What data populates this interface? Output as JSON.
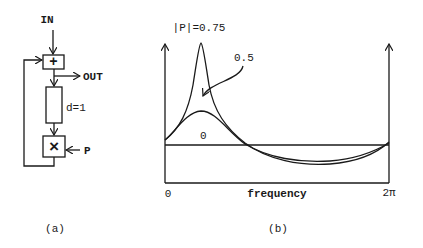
{
  "panel_a": {
    "caption": "(a)",
    "input_label": "IN",
    "output_label": "OUT",
    "adder_symbol": "+",
    "delay_label": "d=1",
    "multiplier_symbol": "×",
    "coefficient_label": "P"
  },
  "panel_b": {
    "caption": "(b)",
    "xlabel": "frequency",
    "x_start_label": "0",
    "x_end_label": "2π",
    "curve_labels": {
      "p075": "|P|=0.75",
      "p05": "0.5",
      "p0": "0"
    }
  },
  "colors": {
    "ink": "#1a1a1a",
    "background": "#ffffff"
  }
}
